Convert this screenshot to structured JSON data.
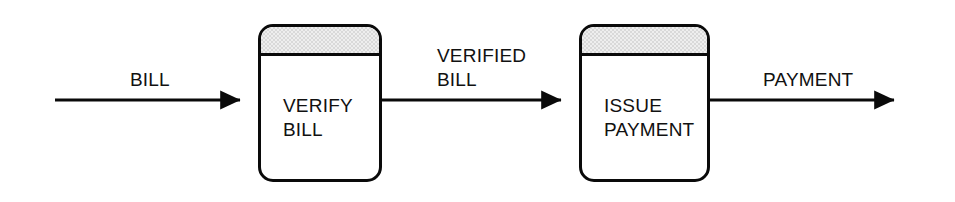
{
  "diagram": {
    "background_color": "#ffffff",
    "line_color": "#0a0a0a",
    "header_fill": "#d9d9d9",
    "box_fill": "#ffffff"
  },
  "processes": [
    {
      "id": "verify-bill",
      "line1": "VERIFY",
      "line2": "BILL",
      "x": 258,
      "y": 24,
      "w": 124,
      "h": 158
    },
    {
      "id": "issue-payment",
      "line1": "ISSUE",
      "line2": "PAYMENT",
      "x": 579,
      "y": 24,
      "w": 131,
      "h": 158
    }
  ],
  "flows": [
    {
      "id": "bill",
      "line1": "BILL",
      "line2": "",
      "label_x": 130,
      "label_y": 68,
      "x1": 55,
      "x2": 258,
      "y": 100
    },
    {
      "id": "verified-bill",
      "line1": "VERIFIED",
      "line2": "BILL",
      "label_x": 437,
      "label_y": 44,
      "x1": 382,
      "x2": 579,
      "y": 100
    },
    {
      "id": "payment",
      "line1": "PAYMENT",
      "line2": "",
      "label_x": 763,
      "label_y": 68,
      "x1": 710,
      "x2": 912,
      "y": 100
    }
  ]
}
